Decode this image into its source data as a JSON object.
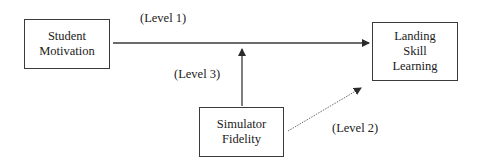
{
  "diagram": {
    "nodes": [
      {
        "id": "student_motivation",
        "lines": [
          "Student",
          "Motivation"
        ]
      },
      {
        "id": "landing_skill_learning",
        "lines": [
          "Landing",
          "Skill",
          "Learning"
        ]
      },
      {
        "id": "simulator_fidelity",
        "lines": [
          "Simulator",
          "Fidelity"
        ]
      }
    ],
    "edges": [
      {
        "from": "student_motivation",
        "to": "landing_skill_learning",
        "label": "(Level 1)",
        "style": "solid"
      },
      {
        "from": "simulator_fidelity",
        "to": "landing_skill_learning",
        "label": "(Level 2)",
        "style": "dotted"
      },
      {
        "from": "simulator_fidelity",
        "to": "edge_level_1",
        "label": "(Level 3)",
        "style": "solid"
      }
    ],
    "colors": {
      "stroke": "#3a3a3a",
      "background": "#ffffff",
      "text": "#1a1a1a"
    }
  }
}
